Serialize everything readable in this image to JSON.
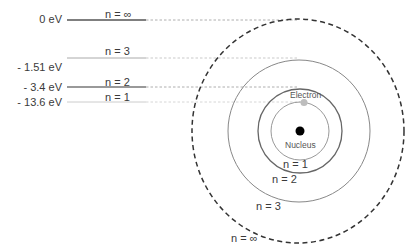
{
  "diagram": {
    "energy_levels": [
      {
        "energy": "0 eV",
        "label": "n = ∞"
      },
      {
        "energy": "- 1.51 eV",
        "label": "n = 3"
      },
      {
        "energy": "- 3.4 eV",
        "label": "n = 2"
      },
      {
        "energy": "- 13.6 eV",
        "label": "n = 1"
      }
    ],
    "orbits": [
      {
        "label": "n = 1"
      },
      {
        "label": "n = 2"
      },
      {
        "label": "n = 3"
      },
      {
        "label": "n = ∞"
      }
    ],
    "electron_label": "Electron",
    "nucleus_label": "Nucleus",
    "colors": {
      "line": "#555555",
      "dashed_outer": "#3a3a3a",
      "electron": "#bdbdbd",
      "nucleus": "#000000"
    }
  }
}
